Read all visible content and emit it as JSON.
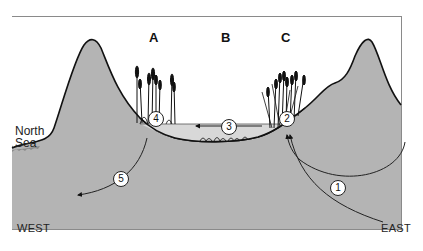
{
  "diagram": {
    "zones": [
      {
        "id": "A",
        "label": "A"
      },
      {
        "id": "B",
        "label": "B"
      },
      {
        "id": "C",
        "label": "C"
      }
    ],
    "directions": {
      "west": "WEST",
      "east": "EAST"
    },
    "water_body": {
      "line1": "North",
      "line2": "Sea"
    },
    "flow_markers": [
      {
        "id": "1",
        "label": "1"
      },
      {
        "id": "2",
        "label": "2"
      },
      {
        "id": "3",
        "label": "3"
      },
      {
        "id": "4",
        "label": "4"
      },
      {
        "id": "5",
        "label": "5"
      }
    ],
    "colors": {
      "ground": "#b4b4b4",
      "water": "#d8d8d8",
      "outline": "#111111",
      "background": "#ffffff"
    }
  }
}
